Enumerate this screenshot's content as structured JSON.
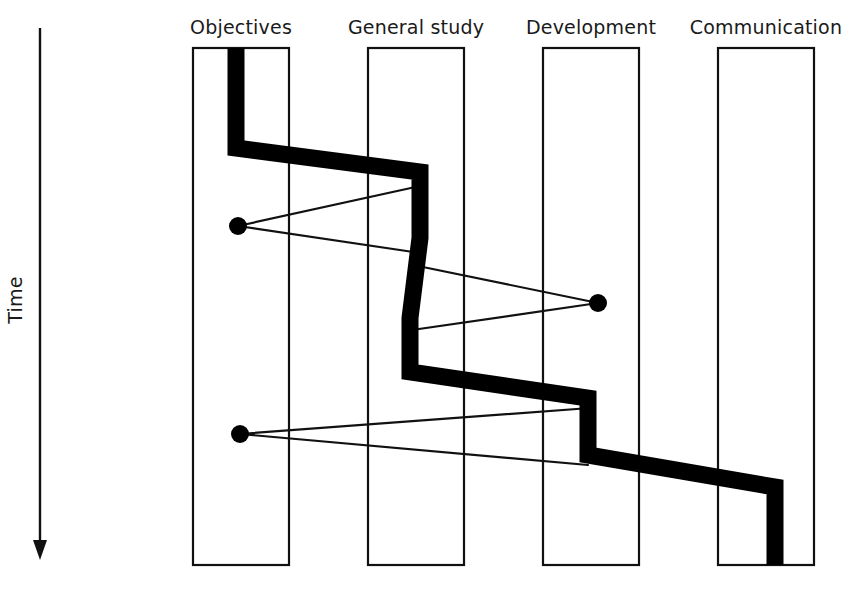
{
  "figure": {
    "type": "process-flow-diagram",
    "title": "",
    "background": "#ffffff",
    "ink_color": "#000000"
  },
  "time_axis": {
    "label": "Time",
    "direction": "downward",
    "arrow_icon": "down-arrow-icon",
    "line_x": 40,
    "line_top": 28,
    "line_bottom": 560,
    "label_x": 22,
    "label_y": 300
  },
  "columns": [
    {
      "id": "objectives",
      "label": "Objectives",
      "box_x": 193,
      "box_y": 48,
      "box_w": 96,
      "box_h": 517,
      "label_x": 241,
      "label_y": 34
    },
    {
      "id": "general-study",
      "label": "General study",
      "box_x": 368,
      "box_y": 48,
      "box_w": 96,
      "box_h": 517,
      "label_x": 416,
      "label_y": 34
    },
    {
      "id": "development",
      "label": "Development",
      "box_x": 543,
      "box_y": 48,
      "box_w": 96,
      "box_h": 517,
      "label_x": 591,
      "label_y": 34
    },
    {
      "id": "communication",
      "label": "Communication",
      "box_x": 718,
      "box_y": 48,
      "box_w": 96,
      "box_h": 517,
      "label_x": 766,
      "label_y": 34
    }
  ],
  "main_path": {
    "name": "project-progress-path",
    "stroke_width": 17,
    "description": "Thick zig-zag band tracing the project's progression through the four activity lanes over time",
    "points": [
      [
        236,
        48
      ],
      [
        236,
        148
      ],
      [
        420,
        172
      ],
      [
        420,
        238
      ],
      [
        410,
        318
      ],
      [
        410,
        372
      ],
      [
        588,
        398
      ],
      [
        588,
        455
      ],
      [
        775,
        487
      ],
      [
        775,
        565
      ]
    ]
  },
  "nodes": [
    {
      "id": "node-1",
      "name": "iteration-node-objectives-upper",
      "cx": 238,
      "cy": 226,
      "r": 9,
      "column": "objectives"
    },
    {
      "id": "node-2",
      "name": "iteration-node-development",
      "cx": 598,
      "cy": 303,
      "r": 9,
      "column": "development"
    },
    {
      "id": "node-3",
      "name": "iteration-node-objectives-lower",
      "cx": 240,
      "cy": 434,
      "r": 9,
      "column": "objectives"
    }
  ],
  "links": [
    {
      "id": "link-1",
      "name": "feedback-link-1",
      "from_node": "node-1",
      "x1": 238,
      "y1": 226,
      "x2": 420,
      "y2": 186
    },
    {
      "id": "link-2",
      "name": "feedback-link-2",
      "from_node": "node-1",
      "x1": 238,
      "y1": 226,
      "x2": 420,
      "y2": 253
    },
    {
      "id": "link-3",
      "name": "feedback-link-3",
      "from_node": "node-2",
      "x1": 598,
      "y1": 303,
      "x2": 418,
      "y2": 266
    },
    {
      "id": "link-4",
      "name": "feedback-link-4",
      "from_node": "node-2",
      "x1": 598,
      "y1": 303,
      "x2": 412,
      "y2": 330
    },
    {
      "id": "link-5",
      "name": "feedback-link-5",
      "from_node": "node-3",
      "x1": 240,
      "y1": 434,
      "x2": 590,
      "y2": 408
    },
    {
      "id": "link-6",
      "name": "feedback-link-6",
      "from_node": "node-3",
      "x1": 240,
      "y1": 434,
      "x2": 588,
      "y2": 465
    }
  ]
}
